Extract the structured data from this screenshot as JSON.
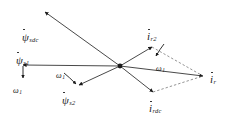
{
  "figure": {
    "type": "vector-phasor-diagram",
    "background": "#ffffff",
    "ink": "#1a1a1a",
    "width": 236,
    "height": 123,
    "origin": {
      "x": 120,
      "y": 66
    }
  },
  "labels": {
    "psi_sdc": {
      "symbol": "ψ",
      "subscript": "sdc",
      "x": 22,
      "y": 28
    },
    "psi_s1": {
      "symbol": "ψ",
      "subscript": "s1",
      "x": 16,
      "y": 52
    },
    "psi_s2": {
      "symbol": "ψ",
      "subscript": "s2",
      "x": 62,
      "y": 92
    },
    "omega_1_left": {
      "symbol": "ω",
      "subscript": "1",
      "x": 14,
      "y": 76
    },
    "omega_1_center": {
      "symbol": "ω",
      "subscript": "1",
      "x": 57,
      "y": 68
    },
    "omega_1_right": {
      "symbol": "ω",
      "subscript": "1",
      "x": 157,
      "y": 60
    },
    "i_r2": {
      "symbol": "i",
      "subscript": "r2",
      "x": 146,
      "y": 29
    },
    "i_rdc": {
      "symbol": "i",
      "subscript": "rdc",
      "x": 150,
      "y": 100
    },
    "i_r": {
      "symbol": "i",
      "subscript": "r",
      "x": 211,
      "y": 72
    }
  },
  "vectors": [
    {
      "name": "psi-sdc-vector",
      "from": [
        120,
        66
      ],
      "to": [
        45,
        12
      ],
      "style": "solid",
      "arrow": true
    },
    {
      "name": "psi-s1-vector",
      "from": [
        120,
        66
      ],
      "to": [
        23,
        65
      ],
      "style": "solid",
      "arrow": true
    },
    {
      "name": "psi-s2-vector",
      "from": [
        120,
        66
      ],
      "to": [
        79,
        85
      ],
      "style": "solid",
      "arrow": true
    },
    {
      "name": "i-r2-vector",
      "from": [
        120,
        66
      ],
      "to": [
        152,
        47
      ],
      "style": "solid",
      "arrow": true
    },
    {
      "name": "i-rdc-vector",
      "from": [
        120,
        66
      ],
      "to": [
        153,
        92
      ],
      "style": "solid",
      "arrow": true
    },
    {
      "name": "i-r-vector",
      "from": [
        120,
        66
      ],
      "to": [
        203,
        76
      ],
      "style": "solid",
      "arrow": true
    },
    {
      "name": "parallelogram-side-top",
      "from": [
        152,
        47
      ],
      "to": [
        203,
        76
      ],
      "style": "dashed",
      "arrow": false
    },
    {
      "name": "parallelogram-side-bottom",
      "from": [
        153,
        92
      ],
      "to": [
        203,
        76
      ],
      "style": "dashed",
      "arrow": false
    }
  ],
  "annotations": [
    {
      "name": "omega-1-left-arrow",
      "from": [
        23,
        66
      ],
      "to": [
        23,
        78
      ],
      "style": "solid",
      "arrow": true
    },
    {
      "name": "omega-1-center-arrow",
      "from": [
        64,
        74
      ],
      "to": [
        76,
        84
      ],
      "style": "solid",
      "arrow": true
    },
    {
      "name": "omega-1-right-arrow",
      "from": [
        163,
        45
      ],
      "to": [
        155,
        56
      ],
      "style": "solid",
      "arrow": true
    }
  ]
}
